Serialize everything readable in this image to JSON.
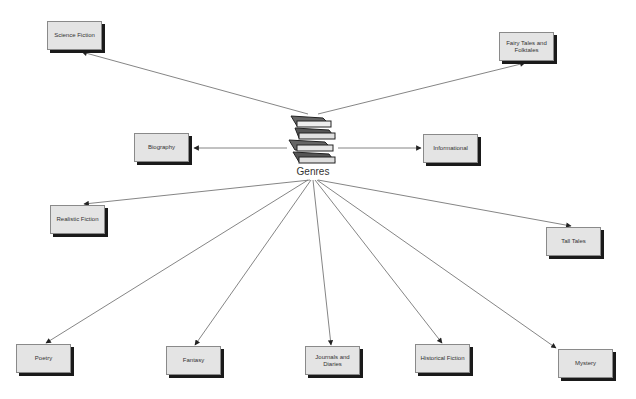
{
  "diagram": {
    "center": {
      "label": "Genres",
      "icon": "book-stack-icon",
      "x": 313,
      "y": 148
    },
    "colors": {
      "node_fill": "#e4e4e4",
      "node_border": "#8a8a8a",
      "shadow": "#1a1a1a",
      "edge": "#777777",
      "text": "#333333"
    },
    "nodes": [
      {
        "id": "science-fiction",
        "label": "Science Fiction",
        "x": 47,
        "y": 21
      },
      {
        "id": "fairy-tales",
        "label": "Fairy Tales and Folktales",
        "x": 499,
        "y": 32
      },
      {
        "id": "biography",
        "label": "Biography",
        "x": 134,
        "y": 133
      },
      {
        "id": "informational",
        "label": "Informational",
        "x": 423,
        "y": 134
      },
      {
        "id": "realistic-fiction",
        "label": "Realistic Fiction",
        "x": 50,
        "y": 205
      },
      {
        "id": "tall-tales",
        "label": "Tall Tales",
        "x": 546,
        "y": 227
      },
      {
        "id": "poetry",
        "label": "Poetry",
        "x": 16,
        "y": 344
      },
      {
        "id": "fantasy",
        "label": "Fantasy",
        "x": 166,
        "y": 346
      },
      {
        "id": "journals-diaries",
        "label": "Journals and Diaries",
        "x": 305,
        "y": 346
      },
      {
        "id": "historical-fiction",
        "label": "Historical Fiction",
        "x": 415,
        "y": 344
      },
      {
        "id": "mystery",
        "label": "Mystery",
        "x": 558,
        "y": 349
      }
    ]
  }
}
